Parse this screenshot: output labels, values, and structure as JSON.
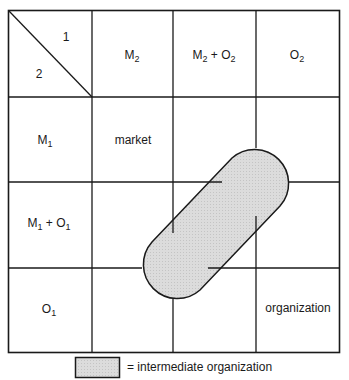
{
  "diagram": {
    "corner": {
      "top_label": "1",
      "bottom_label": "2"
    },
    "column_headers": [
      {
        "base": "M",
        "sub": "2",
        "rest": ""
      },
      {
        "base": "M",
        "sub": "2",
        "rest": " + O",
        "sub2": "2"
      },
      {
        "base": "O",
        "sub": "2",
        "rest": ""
      }
    ],
    "row_headers": [
      {
        "base": "M",
        "sub": "1",
        "rest": ""
      },
      {
        "base": "M",
        "sub": "1",
        "rest": " + O",
        "sub2": "1"
      },
      {
        "base": "O",
        "sub": "1",
        "rest": ""
      }
    ],
    "cells": {
      "market": "market",
      "organization": "organization"
    },
    "shape_fill": "#d9d9d9",
    "line_color": "#1a1a1a"
  },
  "legend": {
    "text": "= intermediate organization"
  }
}
